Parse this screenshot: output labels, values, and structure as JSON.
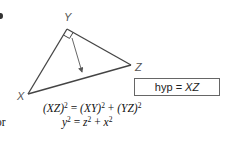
{
  "figure": {
    "vertices": {
      "X": {
        "label": "X",
        "x": 28,
        "y": 94
      },
      "Y": {
        "label": "Y",
        "x": 67,
        "y": 29
      },
      "Z": {
        "label": "Z",
        "x": 131,
        "y": 65
      }
    },
    "right_angle_at": "Y",
    "arrow": {
      "from": [
        72,
        38
      ],
      "to": [
        82,
        73
      ]
    },
    "hyp_box": {
      "prefix": "hyp =",
      "value": "XZ"
    }
  },
  "equations": {
    "line1": {
      "lhs": "(XZ)",
      "lhs_exp": "2",
      "eq": "=",
      "t1": "(XY)",
      "t1_exp": "2",
      "plus": "+",
      "t2": "(YZ)",
      "t2_exp": "2"
    },
    "line2": {
      "prefix": "or",
      "lhs": "y",
      "lhs_exp": "2",
      "eq": "=",
      "t1": "z",
      "t1_exp": "2",
      "plus": "+",
      "t2": "x",
      "t2_exp": "2"
    }
  },
  "colors": {
    "line": "#444444",
    "label": "#555555",
    "text": "#111111"
  }
}
